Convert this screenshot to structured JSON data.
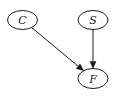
{
  "diagram": {
    "type": "directed-graph",
    "nodes": [
      {
        "id": "C",
        "label": "C"
      },
      {
        "id": "S",
        "label": "S"
      },
      {
        "id": "F",
        "label": "F"
      }
    ],
    "edges": [
      {
        "from": "C",
        "to": "F"
      },
      {
        "from": "S",
        "to": "F"
      }
    ],
    "colors": {
      "stroke": "#1a1a1a",
      "fill": "#ffffff",
      "background": "#ffffff"
    }
  }
}
